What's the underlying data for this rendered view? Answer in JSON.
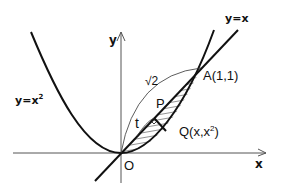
{
  "diagram": {
    "type": "math-graph",
    "curves": [
      {
        "id": "parabola",
        "equation": "y=x^2",
        "label": "y=x",
        "label_sup": "2"
      },
      {
        "id": "line",
        "equation": "y=x",
        "label": "y=x"
      }
    ],
    "axes": {
      "x_label": "x",
      "y_label": "y",
      "origin_label": "O"
    },
    "points": {
      "A": {
        "label": "A(1,1)",
        "x": 1,
        "y": 1
      },
      "P": {
        "label": "P"
      },
      "Q": {
        "label": "Q(x,x",
        "label_sup": "2",
        "label_end": ")"
      }
    },
    "annotations": {
      "arc_length": "√2",
      "t": "t"
    },
    "shaded_region": "region between y=x and y=x^2 for 0<=x<=1 (hatched)",
    "colors": {
      "ink": "#111111",
      "axis": "#555555",
      "background": "#ffffff"
    }
  }
}
